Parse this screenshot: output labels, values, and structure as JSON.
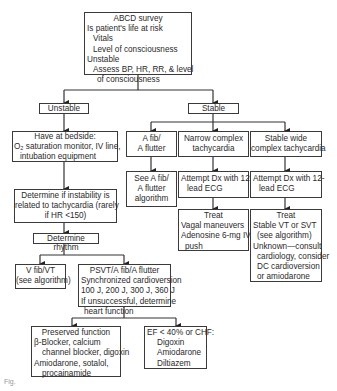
{
  "diagram": {
    "nodes": {
      "abcd": {
        "title": "ABCD survey",
        "lines": [
          "Is patient's life at risk",
          "Vitals",
          "Level of consciousness",
          "Unstable",
          "Assess BP, HR, RR, & level",
          "of consciousness"
        ]
      },
      "unstable": {
        "label": "Unstable"
      },
      "stable": {
        "label": "Stable"
      },
      "bedside": {
        "lines": [
          "Have at bedside:",
          "O₂ saturation monitor, IV line,",
          "intubation equipment"
        ]
      },
      "afib": {
        "lines": [
          "A fib/",
          "A flutter"
        ]
      },
      "narrow": {
        "lines": [
          "Narrow complex",
          "tachycardia"
        ]
      },
      "wide": {
        "lines": [
          "Stable wide",
          "complex tachycardia"
        ]
      },
      "see_afib": {
        "lines": [
          "See A fib/",
          "A flutter",
          "algorithm"
        ]
      },
      "ecg_narrow": {
        "lines": [
          "Attempt Dx with 12-",
          "lead ECG"
        ]
      },
      "ecg_wide": {
        "lines": [
          "Attempt Dx with 12-",
          "lead ECG"
        ]
      },
      "determine_instability": {
        "lines": [
          "Determine if instability is",
          "related to tachycardia (rarely",
          "if HR <150)"
        ]
      },
      "treat_narrow": {
        "lines": [
          "Treat",
          "Vagal maneuvers",
          "Adenosine 6-mg IV",
          "push"
        ]
      },
      "treat_wide": {
        "lines": [
          "Treat",
          "Stable VT or SVT",
          "(see algorithm)",
          "Unknown—consult",
          "cardiology, consider",
          "DC cardioversion",
          "or amiodarone"
        ]
      },
      "determine_rhythm": {
        "label": "Determine rhythm"
      },
      "vfib": {
        "lines": [
          "V fib/VT",
          "(see algorithm)"
        ]
      },
      "psvt": {
        "lines": [
          "PSVT/A fib/A flutter",
          "Synchronized cardioversion",
          "100 J, 200 J, 300 J, 360 J",
          "If unsuccessful, determine",
          "heart function"
        ]
      },
      "preserved": {
        "lines": [
          "Preserved function",
          "β-Blocker, calcium",
          "channel blocker, digoxin",
          "Amiodarone, sotalol,",
          "procainamide"
        ]
      },
      "ef": {
        "lines": [
          "EF < 40% or CHF:",
          "Digoxin",
          "Amiodarone",
          "Diltiazem"
        ]
      }
    },
    "caption": "Fig."
  }
}
